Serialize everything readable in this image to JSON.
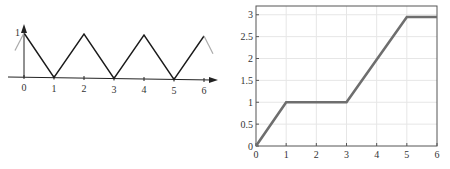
{
  "chart_data": [
    {
      "type": "line",
      "title": "",
      "description": "Triangle wave (periodic)",
      "xlabel": "",
      "ylabel": "",
      "x_ticks": [
        "0",
        "1",
        "2",
        "3",
        "4",
        "5",
        "6"
      ],
      "y_ticks": [
        "1"
      ],
      "xlim": [
        -0.3,
        6.5
      ],
      "ylim": [
        0,
        1
      ],
      "grid": false,
      "axes_style": "arrows",
      "series": [
        {
          "name": "main",
          "color": "#1a1a1a",
          "x": [
            0,
            1,
            2,
            3,
            4,
            5,
            6
          ],
          "y": [
            1,
            0,
            1,
            0,
            1,
            0,
            1
          ]
        },
        {
          "name": "extension-left",
          "color": "#aaaaaa",
          "x": [
            -0.3,
            0
          ],
          "y": [
            0.6,
            1
          ]
        },
        {
          "name": "extension-right",
          "color": "#aaaaaa",
          "x": [
            6,
            6.3
          ],
          "y": [
            1,
            0.6
          ]
        }
      ]
    },
    {
      "type": "line",
      "title": "",
      "description": "Piecewise-linear cumulative function",
      "xlabel": "",
      "ylabel": "",
      "x_ticks": [
        "0",
        "1",
        "2",
        "3",
        "4",
        "5",
        "6"
      ],
      "y_ticks": [
        "0",
        "0.5",
        "1",
        "1.5",
        "2",
        "2.5",
        "3"
      ],
      "xlim": [
        0,
        6
      ],
      "ylim": [
        0,
        3.2
      ],
      "grid": true,
      "series": [
        {
          "name": "main",
          "color": "#6e6e6e",
          "x": [
            0,
            1,
            3,
            5,
            6
          ],
          "y": [
            0,
            1,
            1,
            2.95,
            2.95
          ]
        }
      ]
    }
  ]
}
